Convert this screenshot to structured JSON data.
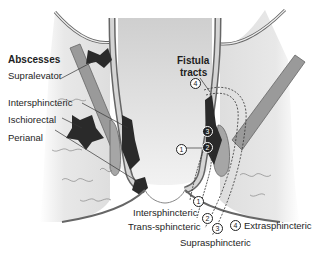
{
  "diagram": {
    "abscesses": {
      "heading": "Abscesses",
      "items": [
        {
          "label": "Supralevator"
        },
        {
          "label": "Intersphincteric"
        },
        {
          "label": "Ischiorectal"
        },
        {
          "label": "Perianal"
        }
      ]
    },
    "fistula": {
      "heading_line1": "Fistula",
      "heading_line2": "tracts",
      "markers": [
        "1",
        "2",
        "3",
        "4"
      ],
      "items": [
        {
          "num": "1",
          "label": "Intersphincteric"
        },
        {
          "num": "2",
          "label": "Trans-sphincteric"
        },
        {
          "num": "3",
          "label": "Suprasphincteric"
        },
        {
          "num": "4",
          "label": "Extrasphincteric"
        }
      ]
    },
    "colors": {
      "abscess": "#2a2a2a",
      "muscle": "#9a9a9a",
      "wall": "#c8c8c8",
      "fat": "#e6e6e6",
      "outline": "#555555"
    }
  }
}
